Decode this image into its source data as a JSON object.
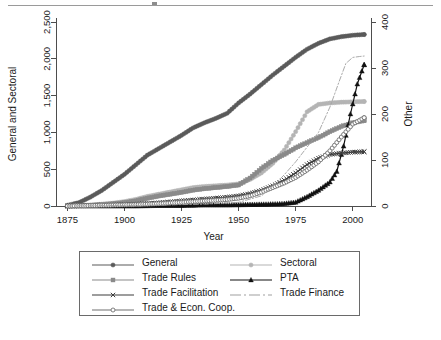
{
  "figure": {
    "top_rule": true,
    "background": "#ffffff"
  },
  "chart_data": {
    "type": "line",
    "title": "",
    "subtitle": "",
    "xlabel": "Year",
    "ylabel": "General and Sectoral",
    "y2label": "Other",
    "xlim": [
      1870,
      2008
    ],
    "ylim": [
      0,
      2500
    ],
    "y2lim": [
      0,
      400
    ],
    "xticks": [
      1875,
      1900,
      1925,
      1950,
      1975,
      2000
    ],
    "xticklabels": [
      "1875",
      "1900",
      "1925",
      "1950",
      "1975",
      "2000"
    ],
    "yticks": [
      0,
      500,
      1000,
      1500,
      2000,
      2500
    ],
    "yticklabels": [
      "0",
      "500",
      "1,000",
      "1,500",
      "2,000",
      "2,500"
    ],
    "y2ticks": [
      0,
      100,
      200,
      300,
      400
    ],
    "y2ticklabels": [
      "0",
      "100",
      "200",
      "300",
      "400"
    ],
    "grid": false,
    "legend_position": "bottom",
    "legend_columns": 2,
    "colors": {
      "general": "#5a5a5a",
      "sectoral": "#b4b4b4",
      "trade_rules": "#8a8a8a",
      "pta": "#111111",
      "trade_facilitation": "#3d3d3d",
      "trade_finance": "#a0a0a0",
      "trade_econ_coop": "#707070",
      "axis": "#4d4d4d",
      "legend_border": "#6a6a6a"
    },
    "series": [
      {
        "name": "General",
        "axis": "left",
        "marker": "filled-circle",
        "color": "#5a5a5a",
        "x": [
          1875,
          1880,
          1885,
          1890,
          1895,
          1900,
          1905,
          1910,
          1915,
          1920,
          1925,
          1930,
          1935,
          1940,
          1945,
          1950,
          1955,
          1960,
          1965,
          1970,
          1975,
          1980,
          1985,
          1990,
          1995,
          2000,
          2005
        ],
        "values": [
          10,
          45,
          120,
          210,
          320,
          430,
          560,
          690,
          780,
          870,
          960,
          1060,
          1130,
          1190,
          1260,
          1400,
          1520,
          1650,
          1780,
          1900,
          2020,
          2130,
          2210,
          2270,
          2300,
          2320,
          2330
        ]
      },
      {
        "name": "Sectoral",
        "axis": "left",
        "marker": "filled-circle-light",
        "color": "#b4b4b4",
        "x": [
          1875,
          1880,
          1885,
          1890,
          1895,
          1900,
          1905,
          1910,
          1915,
          1920,
          1925,
          1930,
          1935,
          1940,
          1945,
          1950,
          1955,
          1960,
          1965,
          1970,
          1975,
          1980,
          1985,
          1990,
          1995,
          2000,
          2005
        ],
        "values": [
          2,
          6,
          14,
          25,
          40,
          60,
          90,
          130,
          160,
          190,
          220,
          250,
          265,
          275,
          285,
          300,
          360,
          450,
          580,
          760,
          1010,
          1280,
          1380,
          1400,
          1410,
          1415,
          1420
        ]
      },
      {
        "name": "Trade Rules",
        "axis": "left",
        "marker": "filled-square",
        "color": "#8a8a8a",
        "x": [
          1875,
          1880,
          1885,
          1890,
          1895,
          1900,
          1905,
          1910,
          1915,
          1920,
          1925,
          1930,
          1935,
          1940,
          1945,
          1950,
          1955,
          1960,
          1965,
          1970,
          1975,
          1980,
          1985,
          1990,
          1995,
          2000,
          2005
        ],
        "values": [
          1,
          4,
          10,
          18,
          30,
          45,
          70,
          105,
          135,
          160,
          185,
          215,
          235,
          250,
          265,
          285,
          380,
          510,
          620,
          700,
          790,
          860,
          930,
          1010,
          1080,
          1130,
          1160
        ]
      },
      {
        "name": "PTA",
        "axis": "right",
        "marker": "filled-triangle",
        "color": "#111111",
        "x": [
          1875,
          1885,
          1895,
          1905,
          1915,
          1925,
          1935,
          1945,
          1955,
          1965,
          1970,
          1975,
          1980,
          1985,
          1990,
          1993,
          1996,
          1999,
          2002,
          2005
        ],
        "values": [
          0,
          0,
          0,
          0,
          1,
          1,
          2,
          2,
          3,
          4,
          5,
          8,
          20,
          34,
          52,
          75,
          130,
          200,
          265,
          307
        ]
      },
      {
        "name": "Trade Facilitation",
        "axis": "right",
        "marker": "cross",
        "color": "#3d3d3d",
        "x": [
          1875,
          1885,
          1895,
          1905,
          1915,
          1925,
          1935,
          1945,
          1950,
          1955,
          1960,
          1965,
          1970,
          1975,
          1980,
          1985,
          1990,
          1995,
          2000,
          2005
        ],
        "values": [
          0,
          1,
          2,
          4,
          7,
          11,
          15,
          19,
          22,
          27,
          34,
          44,
          56,
          72,
          90,
          104,
          112,
          115,
          117,
          118
        ]
      },
      {
        "name": "Trade & Econ. Coop.",
        "axis": "right",
        "marker": "open-circle",
        "color": "#707070",
        "x": [
          1875,
          1885,
          1895,
          1905,
          1915,
          1925,
          1935,
          1945,
          1950,
          1955,
          1960,
          1965,
          1970,
          1975,
          1980,
          1985,
          1990,
          1995,
          2000,
          2005
        ],
        "values": [
          0,
          1,
          2,
          3,
          5,
          8,
          11,
          14,
          17,
          22,
          30,
          40,
          50,
          62,
          78,
          96,
          120,
          150,
          178,
          192
        ]
      },
      {
        "name": "Trade Finance",
        "axis": "right",
        "marker": "none",
        "linestyle": "dashdot",
        "color": "#a0a0a0",
        "x": [
          1875,
          1895,
          1915,
          1935,
          1950,
          1960,
          1965,
          1970,
          1975,
          1980,
          1985,
          1990,
          1994,
          1997,
          2000,
          2003,
          2005
        ],
        "values": [
          0,
          1,
          2,
          4,
          8,
          22,
          42,
          68,
          96,
          128,
          160,
          215,
          270,
          310,
          323,
          325,
          326
        ]
      }
    ]
  },
  "legend": {
    "entries": [
      {
        "label": "General",
        "marker": "filled-circle",
        "color": "#5a5a5a"
      },
      {
        "label": "Sectoral",
        "marker": "filled-circle-light",
        "color": "#b4b4b4"
      },
      {
        "label": "Trade Rules",
        "marker": "filled-square",
        "color": "#8a8a8a"
      },
      {
        "label": "PTA",
        "marker": "filled-triangle",
        "color": "#111111"
      },
      {
        "label": "Trade Facilitation",
        "marker": "cross",
        "color": "#3d3d3d"
      },
      {
        "label": "Trade Finance",
        "marker": "none",
        "color": "#a0a0a0"
      },
      {
        "label": "Trade & Econ. Coop.",
        "marker": "open-circle",
        "color": "#707070"
      }
    ]
  }
}
